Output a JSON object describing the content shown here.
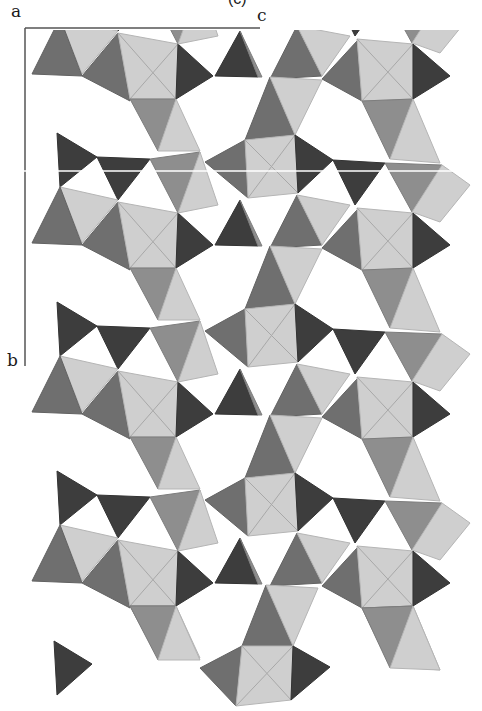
{
  "figure": {
    "panel_label": "(c)",
    "axes": {
      "origin_label": "a",
      "horizontal_label": "c",
      "vertical_label": "b"
    },
    "colors": {
      "light": "#cfcfcf",
      "mid": "#8e8e8e",
      "midDark": "#6f6f6f",
      "dark": "#3d3d3d",
      "axis": "#555555",
      "edge": "#9a9a9a"
    },
    "repeat_period_px": 169,
    "repeat_count": 5
  }
}
